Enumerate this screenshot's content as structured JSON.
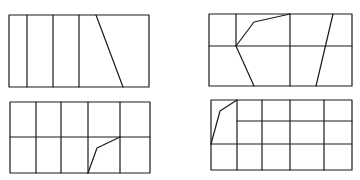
{
  "diagram": {
    "stroke_color": "#1a1a1a",
    "background_color": "#ffffff",
    "figures": [
      {
        "id": "fig-1",
        "position": "top-left",
        "rect": {
          "x": 9,
          "y": 15,
          "w": 140,
          "h": 72
        },
        "lines": [
          {
            "x1": 27,
            "y1": 15,
            "x2": 27,
            "y2": 87
          },
          {
            "x1": 53,
            "y1": 15,
            "x2": 53,
            "y2": 87
          },
          {
            "x1": 79,
            "y1": 15,
            "x2": 79,
            "y2": 87
          },
          {
            "x1": 96,
            "y1": 15,
            "x2": 123,
            "y2": 87
          }
        ],
        "polylines": []
      },
      {
        "id": "fig-2",
        "position": "top-right",
        "rect": {
          "x": 209,
          "y": 14,
          "w": 143,
          "h": 72
        },
        "lines": [
          {
            "x1": 209,
            "y1": 46,
            "x2": 352,
            "y2": 46
          },
          {
            "x1": 236,
            "y1": 14,
            "x2": 236,
            "y2": 46
          },
          {
            "x1": 290,
            "y1": 14,
            "x2": 290,
            "y2": 86
          },
          {
            "x1": 333,
            "y1": 14,
            "x2": 316,
            "y2": 86
          }
        ],
        "polylines": [
          "290,14 254,22 236,46 254,86"
        ]
      },
      {
        "id": "fig-3",
        "position": "bottom-left",
        "rect": {
          "x": 10,
          "y": 102,
          "w": 140,
          "h": 71
        },
        "lines": [
          {
            "x1": 10,
            "y1": 137,
            "x2": 150,
            "y2": 137
          },
          {
            "x1": 36,
            "y1": 102,
            "x2": 36,
            "y2": 173
          },
          {
            "x1": 61,
            "y1": 102,
            "x2": 61,
            "y2": 173
          },
          {
            "x1": 88,
            "y1": 102,
            "x2": 88,
            "y2": 173
          },
          {
            "x1": 120,
            "y1": 102,
            "x2": 120,
            "y2": 173
          }
        ],
        "polylines": [
          "88,173 97,148 120,137"
        ]
      },
      {
        "id": "fig-4",
        "position": "bottom-right",
        "rect": {
          "x": 211,
          "y": 100,
          "w": 141,
          "h": 70
        },
        "lines": [
          {
            "x1": 237,
            "y1": 121,
            "x2": 352,
            "y2": 121
          },
          {
            "x1": 211,
            "y1": 144,
            "x2": 352,
            "y2": 144
          },
          {
            "x1": 237,
            "y1": 100,
            "x2": 237,
            "y2": 170
          },
          {
            "x1": 262,
            "y1": 100,
            "x2": 262,
            "y2": 170
          },
          {
            "x1": 290,
            "y1": 100,
            "x2": 290,
            "y2": 170
          },
          {
            "x1": 324,
            "y1": 100,
            "x2": 324,
            "y2": 170
          }
        ],
        "polylines": [
          "211,144 220,111 237,100"
        ]
      }
    ]
  }
}
